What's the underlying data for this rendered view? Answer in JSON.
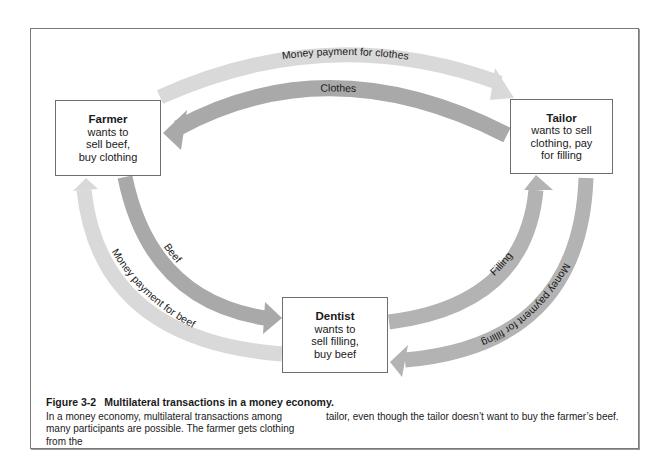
{
  "figure": {
    "number": "Figure 3-2",
    "title": "Multilateral transactions in a money economy.",
    "caption_col1": "In a money economy, multilateral transactions among many participants are possible. The farmer gets clothing from the",
    "caption_col2": "tailor, even though the tailor doesn’t want to buy the farmer’s beef."
  },
  "nodes": {
    "farmer": {
      "name": "Farmer",
      "lines": [
        "wants to",
        "sell beef,",
        "buy clothing"
      ]
    },
    "tailor": {
      "name": "Tailor",
      "lines": [
        "wants to sell",
        "clothing, pay",
        "for filling"
      ]
    },
    "dentist": {
      "name": "Dentist",
      "lines": [
        "wants to",
        "sell filling,",
        "buy beef"
      ]
    }
  },
  "flows": {
    "money_for_clothes": {
      "label": "Money payment for clothes",
      "from": "Farmer",
      "to": "Tailor",
      "color": "#d9d9d9"
    },
    "clothes": {
      "label": "Clothes",
      "from": "Tailor",
      "to": "Farmer",
      "color": "#a9a9a9"
    },
    "beef": {
      "label": "Beef",
      "from": "Farmer",
      "to": "Dentist",
      "color": "#a9a9a9"
    },
    "money_for_beef": {
      "label": "Money payment for beef",
      "from": "Dentist",
      "to": "Farmer",
      "color": "#d9d9d9"
    },
    "filling": {
      "label": "Filling",
      "from": "Dentist",
      "to": "Tailor",
      "color": "#b3b3b3"
    },
    "money_for_filling": {
      "label": "Money payment for filling",
      "from": "Tailor",
      "to": "Dentist",
      "color": "#b3b3b3"
    }
  }
}
